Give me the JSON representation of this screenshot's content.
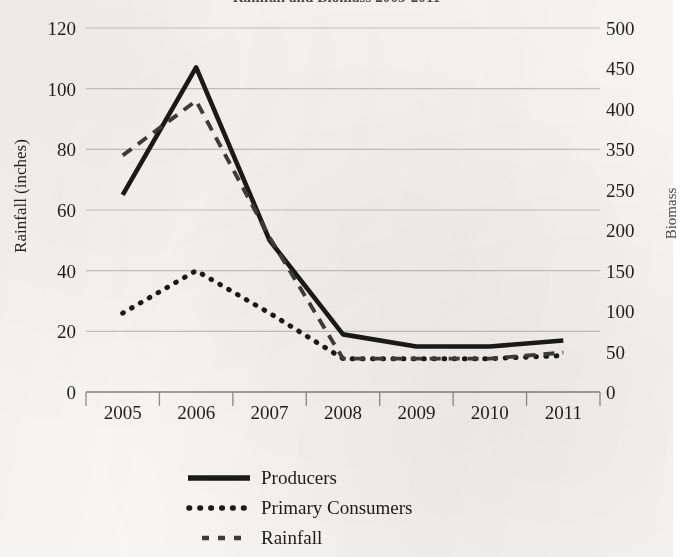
{
  "chart_data": {
    "type": "line",
    "title": "Rainfall and Biomass 2005-2011",
    "title_clipped": true,
    "xlabel": "",
    "ylabel": "Rainfall (inches)",
    "y2label": "Biomass",
    "categories": [
      "2005",
      "2006",
      "2007",
      "2008",
      "2009",
      "2010",
      "2011"
    ],
    "x_tick_labels": [
      "2005",
      "2006",
      "2007",
      "2008",
      "2009",
      "2010",
      "2011"
    ],
    "y_left_ticks": [
      "0",
      "20",
      "40",
      "60",
      "80",
      "100",
      "120"
    ],
    "y_right_ticks": [
      "0",
      "50",
      "100",
      "150",
      "200",
      "250",
      "350",
      "400",
      "450",
      "500"
    ],
    "ylim": [
      0,
      120
    ],
    "y2lim": [
      0,
      500
    ],
    "grid": true,
    "legend_position": "bottom",
    "series": [
      {
        "name": "Producers",
        "axis": "right",
        "style": "solid",
        "color": "#1a1a1a",
        "values": [
          270,
          450,
          210,
          80,
          62,
          62,
          70
        ],
        "values_left_scale": [
          65,
          107,
          50,
          19,
          15,
          15,
          17
        ]
      },
      {
        "name": "Primary Consumers",
        "axis": "right",
        "style": "dotted",
        "color": "#1a1a1a",
        "values": [
          108,
          150,
          98,
          45,
          45,
          45,
          48
        ],
        "values_left_scale": [
          26,
          40,
          26,
          11,
          11,
          11,
          12
        ]
      },
      {
        "name": "Rainfall",
        "axis": "left",
        "style": "dashed",
        "color": "#3d3d3d",
        "values": [
          78,
          96,
          51,
          11,
          11,
          11,
          13
        ]
      }
    ]
  },
  "title": {
    "text": "Rainfall and Biomass 2005-2011"
  },
  "axes": {
    "left_title": "Rainfall (inches)",
    "right_title": "Biomass"
  },
  "legend": {
    "items": [
      {
        "label": "Producers",
        "key": "solid-line-key"
      },
      {
        "label": "Primary Consumers",
        "key": "dotted-line-key"
      },
      {
        "label": "Rainfall",
        "key": "dashed-line-key"
      }
    ]
  },
  "colors": {
    "ink": "#1a1a1a",
    "grid": "#b9b9b9",
    "paper": "#f7f6f4"
  }
}
